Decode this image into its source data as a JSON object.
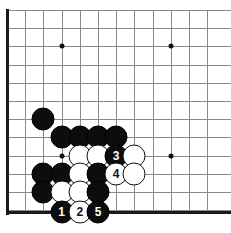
{
  "diagram": {
    "type": "go-board-problem",
    "board": {
      "grid_spacing_px": 18.2,
      "origin_x_px": 7,
      "origin_y_px": 10,
      "columns_visible": 12,
      "rows_visible": 12,
      "left_edge": true,
      "bottom_edge": true,
      "top_edge": false,
      "right_edge": false,
      "line_color": "#8a8a8a",
      "edge_color": "#1a1a1a",
      "background": "#ffffff"
    },
    "star_points": [
      {
        "col": 3,
        "row": 2
      },
      {
        "col": 9,
        "row": 2
      },
      {
        "col": 3,
        "row": 8
      },
      {
        "col": 9,
        "row": 8
      }
    ],
    "stones": [
      {
        "col": 2,
        "row": 6,
        "color": "black",
        "label": ""
      },
      {
        "col": 3,
        "row": 7,
        "color": "black",
        "label": ""
      },
      {
        "col": 4,
        "row": 7,
        "color": "black",
        "label": ""
      },
      {
        "col": 5,
        "row": 7,
        "color": "black",
        "label": ""
      },
      {
        "col": 6,
        "row": 7,
        "color": "black",
        "label": ""
      },
      {
        "col": 4,
        "row": 8,
        "color": "white",
        "label": ""
      },
      {
        "col": 5,
        "row": 8,
        "color": "white",
        "label": ""
      },
      {
        "col": 6,
        "row": 8,
        "color": "black",
        "label": "3"
      },
      {
        "col": 7,
        "row": 8,
        "color": "white",
        "label": ""
      },
      {
        "col": 2,
        "row": 9,
        "color": "black",
        "label": ""
      },
      {
        "col": 3,
        "row": 9,
        "color": "black",
        "label": ""
      },
      {
        "col": 4,
        "row": 9,
        "color": "white",
        "label": ""
      },
      {
        "col": 5,
        "row": 9,
        "color": "black",
        "label": ""
      },
      {
        "col": 6,
        "row": 9,
        "color": "white",
        "label": "4"
      },
      {
        "col": 7,
        "row": 9,
        "color": "white",
        "label": ""
      },
      {
        "col": 2,
        "row": 10,
        "color": "black",
        "label": ""
      },
      {
        "col": 3,
        "row": 10,
        "color": "white",
        "label": ""
      },
      {
        "col": 4,
        "row": 10,
        "color": "white",
        "label": ""
      },
      {
        "col": 5,
        "row": 10,
        "color": "black",
        "label": ""
      },
      {
        "col": 3,
        "row": 11,
        "color": "black",
        "label": "1"
      },
      {
        "col": 4,
        "row": 11,
        "color": "white",
        "label": "2"
      },
      {
        "col": 5,
        "row": 11,
        "color": "black",
        "label": "5"
      }
    ],
    "move_sequence": [
      {
        "number": "1",
        "color": "black"
      },
      {
        "number": "2",
        "color": "white"
      },
      {
        "number": "3",
        "color": "black"
      },
      {
        "number": "4",
        "color": "white"
      },
      {
        "number": "5",
        "color": "black"
      }
    ]
  }
}
